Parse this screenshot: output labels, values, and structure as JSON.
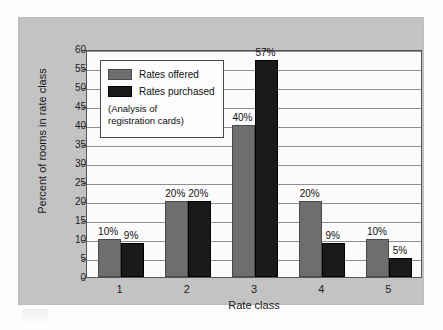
{
  "chart_data": {
    "type": "bar",
    "title": "",
    "xlabel": "Rate class",
    "ylabel": "Percent of rooms in rate class",
    "categories": [
      "1",
      "2",
      "3",
      "4",
      "5"
    ],
    "series": [
      {
        "name": "Rates offered",
        "color": "#6e6e6e",
        "values": [
          10,
          20,
          40,
          20,
          10
        ],
        "labels": [
          "10%",
          "20%",
          "40%",
          "20%",
          "10%"
        ]
      },
      {
        "name": "Rates purchased",
        "color": "#1a1a1a",
        "values": [
          9,
          20,
          57,
          9,
          5
        ],
        "labels": [
          "9%",
          "20%",
          "57%",
          "9%",
          "5%"
        ]
      }
    ],
    "ylim": [
      0,
      60
    ],
    "yticks": [
      0,
      5,
      10,
      15,
      20,
      25,
      30,
      35,
      40,
      45,
      50,
      55,
      60
    ],
    "ytick_labels": [
      "0",
      "5",
      "10",
      "15",
      "20",
      "25",
      "30",
      "35",
      "40",
      "45",
      "50",
      "55",
      "60"
    ],
    "grid": true,
    "legend_position": "top-left",
    "annotations": [
      "(Analysis of",
      "registration cards)"
    ]
  },
  "legend": {
    "items": [
      {
        "label": "Rates offered"
      },
      {
        "label": "Rates purchased"
      }
    ],
    "note_line1": "(Analysis of",
    "note_line2": "registration cards)"
  },
  "colors": {
    "offered": "#6e6e6e",
    "purchased": "#1a1a1a",
    "panel_background": "#c3c3c3",
    "plot_background": "#fbfbfb",
    "gridline": "#8f8f8f",
    "axis": "#555555"
  }
}
